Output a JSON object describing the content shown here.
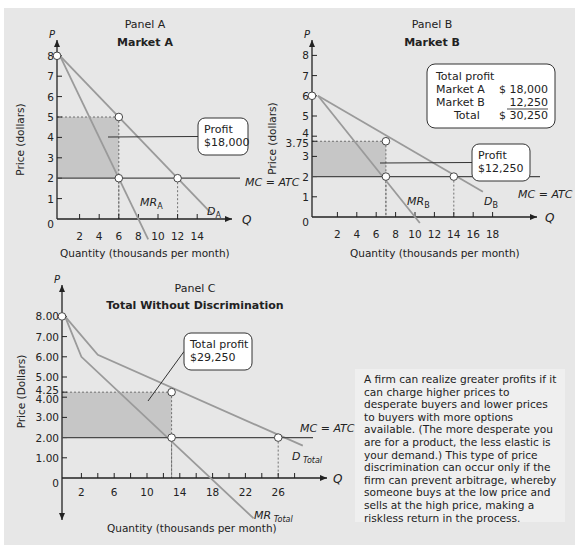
{
  "colors": {
    "background": "#e7e7e7",
    "shade": "#c6c6c6",
    "curve": "#9a9a9a",
    "mc_line": "#4a4a4a",
    "axis": "#222222",
    "callout_fill": "#ffffff"
  },
  "chart_data": [
    {
      "type": "line",
      "panel": "Panel A",
      "title": "Market A",
      "xlabel": "Quantity (thousands per month)",
      "ylabel": "Price (dollars)",
      "x_axis_symbol": "Q",
      "y_axis_symbol": "P",
      "xlim": [
        0,
        16
      ],
      "ylim": [
        0,
        8.5
      ],
      "xticks": [
        2,
        4,
        6,
        8,
        10,
        12,
        14
      ],
      "yticks": [
        0,
        1,
        2,
        3,
        4,
        5,
        6,
        7,
        8
      ],
      "ytick_labels": [
        "0",
        "1",
        "2",
        "3",
        "4",
        "5",
        "6",
        "7",
        "8"
      ],
      "series": [
        {
          "name": "D",
          "subscript": "A",
          "points": [
            [
              0,
              8
            ],
            [
              15.5,
              0.25
            ]
          ]
        },
        {
          "name": "MR",
          "subscript": "A",
          "points": [
            [
              0,
              8
            ],
            [
              9,
              -1
            ]
          ]
        },
        {
          "name": "MC = ATC",
          "points": [
            [
              0,
              2
            ],
            [
              18.5,
              2
            ]
          ]
        }
      ],
      "markers": [
        [
          0,
          8
        ],
        [
          6,
          5
        ],
        [
          6,
          2
        ],
        [
          12,
          2
        ]
      ],
      "profit_rect": {
        "q": 6,
        "p_high": 5,
        "p_low": 2
      },
      "callout": {
        "lines": [
          "Profit",
          "$18,000"
        ]
      }
    },
    {
      "type": "line",
      "panel": "Panel B",
      "title": "Market B",
      "xlabel": "Quantity (thousands per month)",
      "ylabel": "Price (dollars)",
      "x_axis_symbol": "Q",
      "y_axis_symbol": "P",
      "xlim": [
        0,
        20
      ],
      "ylim": [
        0,
        8.5
      ],
      "xticks": [
        2,
        4,
        6,
        8,
        10,
        12,
        14,
        16,
        18
      ],
      "yticks": [
        0,
        1,
        2,
        3,
        3.75,
        4,
        5,
        6,
        7,
        8
      ],
      "ytick_labels": [
        "0",
        "1",
        "2",
        "3",
        "3.75",
        "4",
        "5",
        "6",
        "7",
        "8"
      ],
      "series": [
        {
          "name": "D",
          "subscript": "B",
          "points": [
            [
              0,
              6
            ],
            [
              17,
              1.25
            ]
          ]
        },
        {
          "name": "MR",
          "subscript": "B",
          "points": [
            [
              0,
              6
            ],
            [
              10.5,
              -0.3
            ]
          ]
        },
        {
          "name": "MC = ATC",
          "points": [
            [
              0,
              2
            ],
            [
              23,
              2
            ]
          ]
        }
      ],
      "markers": [
        [
          0,
          6
        ],
        [
          7,
          3.75
        ],
        [
          7,
          2
        ],
        [
          14,
          2
        ]
      ],
      "profit_rect": {
        "q": 7,
        "p_high": 3.75,
        "p_low": 2
      },
      "callout": {
        "lines": [
          "Profit",
          "$12,250"
        ]
      },
      "summary_box": {
        "heading": "Total profit",
        "rows": [
          {
            "label": "Market A",
            "value": "$ 18,000"
          },
          {
            "label": "Market B",
            "value": "12,250"
          },
          {
            "label": "Total",
            "value": "$ 30,250"
          }
        ]
      }
    },
    {
      "type": "line",
      "panel": "Panel C",
      "title": "Total Without Discrimination",
      "xlabel": "Quantity (thousands per month)",
      "ylabel": "Price (Dollars)",
      "x_axis_symbol": "Q",
      "y_axis_symbol": "P",
      "xlim": [
        0,
        30
      ],
      "ylim": [
        -2.5,
        9
      ],
      "xticks": [
        2,
        6,
        10,
        14,
        18,
        22,
        26
      ],
      "xticks_minor_step": 2,
      "yticks": [
        0,
        1,
        2,
        3,
        4,
        4.25,
        5,
        6,
        7,
        8
      ],
      "ytick_labels": [
        "0",
        "1.00",
        "2.00",
        "3.00",
        "4.00",
        "4.25",
        "5.00",
        "6.00",
        "7.00",
        "8.00"
      ],
      "series": [
        {
          "name": "D",
          "subscript": "Total",
          "points": [
            [
              0,
              8
            ],
            [
              4,
              6.1
            ],
            [
              29,
              1.6
            ]
          ]
        },
        {
          "name": "MR",
          "subscript": "Total",
          "points": [
            [
              0,
              8
            ],
            [
              2,
              6
            ],
            [
              23,
              -2
            ]
          ]
        },
        {
          "name": "MC = ATC",
          "points": [
            [
              0,
              2
            ],
            [
              30.5,
              2
            ]
          ]
        }
      ],
      "markers": [
        [
          0,
          8
        ],
        [
          13,
          4.25
        ],
        [
          13,
          2
        ],
        [
          26,
          2
        ]
      ],
      "profit_rect": {
        "q": 13,
        "p_high": 4.25,
        "p_low": 2
      },
      "callout": {
        "lines": [
          "Total profit",
          "$29,250"
        ]
      }
    }
  ],
  "note": {
    "text": "A firm can realize greater profits if it can charge higher prices to desperate buyers and lower prices to buyers with more options available. (The more desperate you are for a product, the less elastic is your demand.) This type of price discrimination can occur only if the firm can prevent arbitrage, whereby someone buys at the low price and sells at the high price, making a riskless return in the process."
  }
}
